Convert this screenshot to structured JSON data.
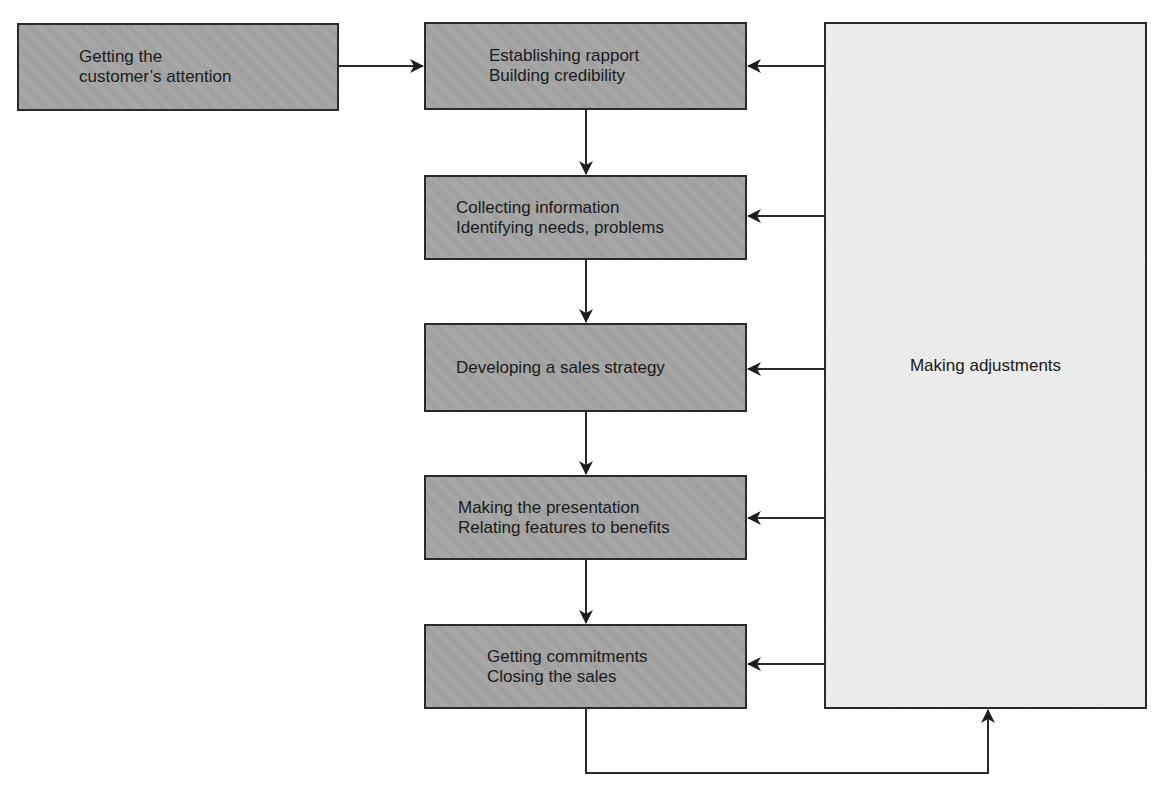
{
  "diagram": {
    "title": "",
    "start": {
      "label": "Getting the\ncustomer’s attention"
    },
    "steps": [
      {
        "label": "Establishing rapport\nBuilding credibility"
      },
      {
        "label": "Collecting information\nIdentifying needs, problems"
      },
      {
        "label": "Developing a sales strategy"
      },
      {
        "label": "Making the presentation\nRelating features to benefits"
      },
      {
        "label": "Getting commitments\nClosing the sales"
      }
    ],
    "feedback": {
      "label": "Making adjustments"
    },
    "edges": [
      {
        "from": "start",
        "to": "step-1"
      },
      {
        "from": "step-1",
        "to": "step-2"
      },
      {
        "from": "step-2",
        "to": "step-3"
      },
      {
        "from": "step-3",
        "to": "step-4"
      },
      {
        "from": "step-4",
        "to": "step-5"
      },
      {
        "from": "step-5",
        "to": "feedback"
      },
      {
        "from": "feedback",
        "to": "step-1"
      },
      {
        "from": "feedback",
        "to": "step-2"
      },
      {
        "from": "feedback",
        "to": "step-3"
      },
      {
        "from": "feedback",
        "to": "step-4"
      },
      {
        "from": "feedback",
        "to": "step-5"
      }
    ],
    "colors": {
      "step_fill": "#a3a3a3",
      "feedback_fill": "#ececec",
      "stroke": "#2a2a2a",
      "text": "#1a1a1a"
    }
  }
}
